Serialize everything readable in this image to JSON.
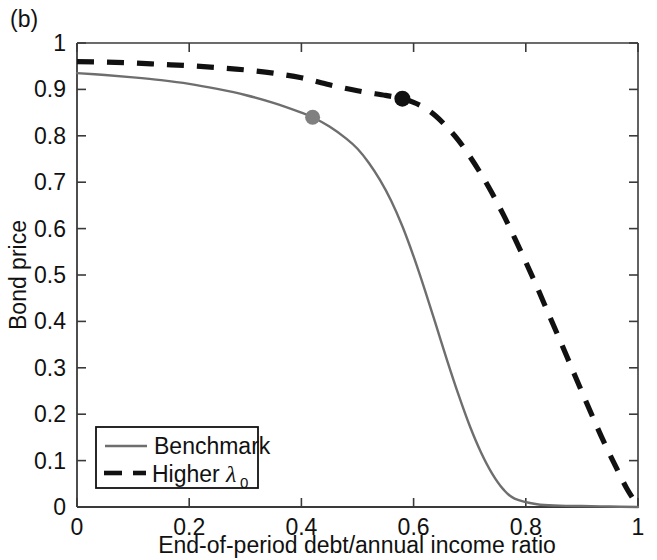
{
  "panel": {
    "label": "(b)"
  },
  "colors": {
    "benchmark_line": "#6e6e6e",
    "higher_lambda_line": "#111111",
    "axis": "#3a3a3a",
    "background": "#ffffff",
    "benchmark_marker": "#808080",
    "higher_lambda_marker": "#111111"
  },
  "axes": {
    "x_ticks": [
      "0",
      "0.2",
      "0.4",
      "0.6",
      "0.8",
      "1"
    ],
    "y_ticks": [
      "0",
      "0.1",
      "0.2",
      "0.3",
      "0.4",
      "0.5",
      "0.6",
      "0.7",
      "0.8",
      "0.9",
      "1"
    ]
  },
  "legend": {
    "items": [
      {
        "label": "Benchmark",
        "style": "solid",
        "color": "#6e6e6e"
      },
      {
        "label": "Higher ",
        "lambda": "λ",
        "subscript": "0",
        "style": "dashed",
        "color": "#111111"
      }
    ]
  },
  "chart_data": {
    "type": "line",
    "title": "(b)",
    "xlabel": "End-of-period debt/annual income ratio",
    "ylabel": "Bond price",
    "xlim": [
      0,
      1
    ],
    "ylim": [
      0,
      1
    ],
    "xticks": [
      0,
      0.2,
      0.4,
      0.6,
      0.8,
      1
    ],
    "yticks": [
      0,
      0.1,
      0.2,
      0.3,
      0.4,
      0.5,
      0.6,
      0.7,
      0.8,
      0.9,
      1
    ],
    "grid": false,
    "legend_position": "lower left",
    "series": [
      {
        "name": "Benchmark",
        "style": "solid",
        "color": "#6e6e6e",
        "x": [
          0.0,
          0.05,
          0.1,
          0.15,
          0.2,
          0.25,
          0.3,
          0.35,
          0.4,
          0.42,
          0.45,
          0.48,
          0.5,
          0.52,
          0.54,
          0.56,
          0.58,
          0.6,
          0.62,
          0.64,
          0.66,
          0.68,
          0.7,
          0.72,
          0.74,
          0.76,
          0.78,
          0.82,
          0.86,
          0.9,
          0.95,
          1.0
        ],
        "y": [
          0.935,
          0.931,
          0.926,
          0.92,
          0.912,
          0.901,
          0.888,
          0.871,
          0.85,
          0.84,
          0.82,
          0.794,
          0.772,
          0.742,
          0.705,
          0.66,
          0.605,
          0.54,
          0.468,
          0.392,
          0.315,
          0.242,
          0.175,
          0.118,
          0.072,
          0.038,
          0.018,
          0.006,
          0.003,
          0.002,
          0.001,
          0.0
        ],
        "marker": {
          "x": 0.42,
          "y": 0.84
        }
      },
      {
        "name": "Higher λ₀",
        "style": "dashed",
        "color": "#111111",
        "x": [
          0.0,
          0.05,
          0.1,
          0.15,
          0.2,
          0.25,
          0.3,
          0.35,
          0.4,
          0.45,
          0.5,
          0.55,
          0.58,
          0.6,
          0.62,
          0.64,
          0.66,
          0.68,
          0.7,
          0.72,
          0.74,
          0.76,
          0.78,
          0.8,
          0.82,
          0.84,
          0.86,
          0.88,
          0.9,
          0.92,
          0.94,
          0.96,
          0.98,
          1.0
        ],
        "y": [
          0.96,
          0.959,
          0.957,
          0.954,
          0.951,
          0.947,
          0.942,
          0.935,
          0.925,
          0.91,
          0.897,
          0.887,
          0.88,
          0.872,
          0.86,
          0.842,
          0.818,
          0.79,
          0.756,
          0.718,
          0.676,
          0.63,
          0.58,
          0.528,
          0.474,
          0.418,
          0.362,
          0.305,
          0.248,
          0.192,
          0.138,
          0.088,
          0.04,
          0.002
        ],
        "marker": {
          "x": 0.58,
          "y": 0.88
        }
      }
    ]
  }
}
